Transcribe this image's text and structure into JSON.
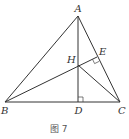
{
  "diagram": {
    "type": "geometry-triangle-orthocenter",
    "points": {
      "A": {
        "label": "A",
        "x": 78,
        "y": 16
      },
      "B": {
        "label": "B",
        "x": 5,
        "y": 102
      },
      "C": {
        "label": "C",
        "x": 120,
        "y": 102
      },
      "D": {
        "label": "D",
        "x": 78,
        "y": 102
      },
      "E": {
        "label": "E",
        "x": 97,
        "y": 57
      },
      "H": {
        "label": "H",
        "x": 78,
        "y": 65
      }
    },
    "segments": [
      "AB",
      "AC",
      "BC",
      "AD",
      "BE",
      "HC"
    ],
    "right_angles": [
      "D",
      "E"
    ],
    "caption": "图 7"
  }
}
